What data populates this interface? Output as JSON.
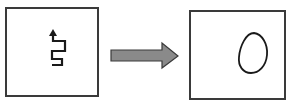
{
  "diagram": {
    "left_panel": {
      "label": "",
      "content": "squiggle-path-with-arrow"
    },
    "connector": {
      "type": "arrow",
      "direction": "right",
      "fill": "#8a8a8a",
      "stroke": "#3a3a3a"
    },
    "right_panel": {
      "label": "",
      "content": "closed-loop-oval"
    }
  },
  "colors": {
    "border": "#3a3a3a",
    "line": "#1a1a1a",
    "arrow_fill": "#8a8a8a",
    "background": "#ffffff"
  }
}
